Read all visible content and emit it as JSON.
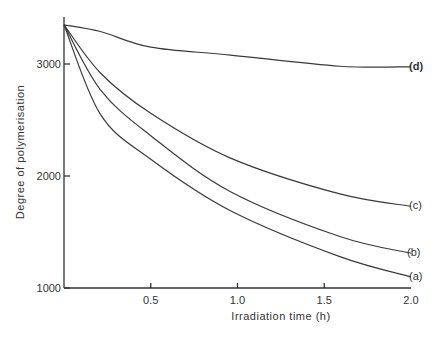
{
  "chart_data": {
    "type": "line",
    "title": "",
    "xlabel": "Irradiation time (h)",
    "ylabel": "Degree of polymerisation",
    "xlim": [
      0,
      2.0
    ],
    "ylim": [
      1000,
      3400
    ],
    "xticks": [
      0.5,
      1.0,
      1.5,
      2.0
    ],
    "xtick_labels": [
      "0.5",
      "1.0",
      "1.5",
      "2.0"
    ],
    "yticks": [
      1000,
      2000,
      3000
    ],
    "ytick_labels": [
      "1000",
      "2000",
      "3000"
    ],
    "grid": false,
    "legend": "inline labels at right end of curves",
    "x": [
      0,
      0.21,
      0.5,
      0.96,
      1.59,
      2.0
    ],
    "series": [
      {
        "name": "(d)",
        "values": [
          3350,
          3290,
          3150,
          3080,
          2980,
          2975
        ]
      },
      {
        "name": "(c)",
        "values": [
          3350,
          2920,
          2560,
          2160,
          1840,
          1730
        ]
      },
      {
        "name": "(b)",
        "values": [
          3350,
          2770,
          2360,
          1860,
          1460,
          1310
        ]
      },
      {
        "name": "(a)",
        "values": [
          3350,
          2550,
          2150,
          1690,
          1280,
          1100
        ]
      }
    ]
  }
}
